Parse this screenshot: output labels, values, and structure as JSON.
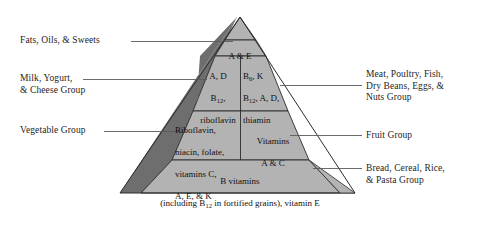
{
  "figure": {
    "name": "food-guide-pyramid",
    "background": "#ffffff",
    "face_light": "#b3b3b3",
    "face_dark": "#6e6e6e",
    "outline": "#2b2b2b",
    "leader_color": "#5a5a5a"
  },
  "tiers": {
    "apex": {
      "name": "fats-oils-sweets-tier",
      "text": "A & E"
    },
    "second_left": {
      "name": "milk-yogurt-cheese-tier",
      "line1": "A, D",
      "line2_pre": "B",
      "line2_sub": "12",
      "line2_post": ",",
      "line3": "riboflavin"
    },
    "second_right": {
      "name": "meat-poultry-fish-tier",
      "line1_pre": "B",
      "line1_sub": "6",
      "line1_post": ", K",
      "line2_pre": "B",
      "line2_sub": "12",
      "line2_post": ", A, D,",
      "line3": "thiamin"
    },
    "third_left": {
      "name": "vegetable-tier",
      "line1": "Riboflavin,",
      "line2": "niacin, folate,",
      "line3": "vitamins C,",
      "line4": "A, E, & K"
    },
    "third_right": {
      "name": "fruit-tier",
      "line1": "Vitamins",
      "line2": "A & C"
    },
    "base": {
      "name": "bread-cereal-rice-pasta-tier",
      "line1": "B vitamins",
      "line2_pre": "(including B",
      "line2_sub": "12",
      "line2_post": " in fortified grains), vitamin E"
    }
  },
  "labels": {
    "left": [
      {
        "name": "label-fats-oils-sweets",
        "text": "Fats, Oils, & Sweets"
      },
      {
        "name": "label-milk-yogurt-cheese",
        "text": "Milk, Yogurt,\n& Cheese Group"
      },
      {
        "name": "label-vegetable-group",
        "text": "Vegetable Group"
      }
    ],
    "right": [
      {
        "name": "label-meat-poultry-fish",
        "text": "Meat, Poultry, Fish,\nDry Beans, Eggs, &\nNuts Group"
      },
      {
        "name": "label-fruit-group",
        "text": "Fruit Group"
      },
      {
        "name": "label-bread-cereal-rice-pasta",
        "text": "Bread, Cereal, Rice,\n& Pasta Group"
      }
    ]
  }
}
